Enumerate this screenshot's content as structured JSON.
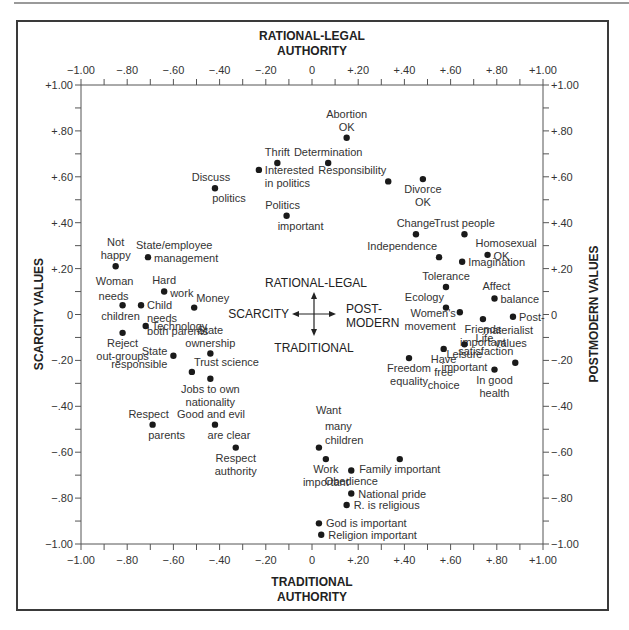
{
  "chart_data": {
    "type": "scatter",
    "title": "",
    "top_axis_title": [
      "RATIONAL-LEGAL",
      "AUTHORITY"
    ],
    "bottom_axis_title": [
      "TRADITIONAL",
      "AUTHORITY"
    ],
    "left_axis_title": "SCARCITY VALUES",
    "right_axis_title": "POSTMODERN VALUES",
    "xlim": [
      -1.0,
      1.0
    ],
    "ylim": [
      -1.0,
      1.0
    ],
    "grid": false,
    "x_tick_labels": [
      "-1.00",
      "-.80",
      "-.60",
      "-.40",
      "-.20",
      "0",
      "+.20",
      "+.40",
      "+.60",
      "+.80",
      "+1.00"
    ],
    "y_tick_labels": [
      "+1.00",
      "+.80",
      "+.60",
      "+.40",
      "+.20",
      "0",
      "-.20",
      "-.40",
      "-.60",
      "-.80",
      "-1.00"
    ],
    "center_compass": {
      "up": "RATIONAL-LEGAL",
      "down": "TRADITIONAL",
      "left": "SCARCITY",
      "right": [
        "POST-",
        "MODERN"
      ]
    },
    "points": [
      {
        "label": [
          "Abortion",
          "OK"
        ],
        "x": 0.15,
        "y": 0.77,
        "pos": "above"
      },
      {
        "label": [
          "Determination"
        ],
        "x": 0.07,
        "y": 0.66,
        "pos": "above"
      },
      {
        "label": [
          "Thrift"
        ],
        "x": -0.15,
        "y": 0.66,
        "pos": "above"
      },
      {
        "label": [
          "Interested",
          "in politics"
        ],
        "x": -0.23,
        "y": 0.63,
        "pos": "right-below"
      },
      {
        "label": [
          "Discuss",
          "politics"
        ],
        "x": -0.42,
        "y": 0.55,
        "pos": "split"
      },
      {
        "label": [
          "Politics",
          "important"
        ],
        "x": -0.11,
        "y": 0.43,
        "pos": "split"
      },
      {
        "label": [
          "Responsibility"
        ],
        "x": 0.33,
        "y": 0.58,
        "pos": "left-above"
      },
      {
        "label": [
          "Divorce",
          "OK"
        ],
        "x": 0.48,
        "y": 0.59,
        "pos": "below"
      },
      {
        "label": [
          "Change"
        ],
        "x": 0.45,
        "y": 0.35,
        "pos": "above"
      },
      {
        "label": [
          "Trust people"
        ],
        "x": 0.66,
        "y": 0.35,
        "pos": "above"
      },
      {
        "label": [
          "Independence"
        ],
        "x": 0.55,
        "y": 0.25,
        "pos": "left-above"
      },
      {
        "label": [
          "Imagination"
        ],
        "x": 0.65,
        "y": 0.23,
        "pos": "right-below"
      },
      {
        "label": [
          "Homosexual",
          "OK"
        ],
        "x": 0.76,
        "y": 0.26,
        "pos": "split-right"
      },
      {
        "label": [
          "Tolerance"
        ],
        "x": 0.58,
        "y": 0.12,
        "pos": "above"
      },
      {
        "label": [
          "Affect",
          "balance"
        ],
        "x": 0.79,
        "y": 0.07,
        "pos": "split-right"
      },
      {
        "label": [
          "Ecology"
        ],
        "x": 0.58,
        "y": 0.03,
        "pos": "left-above"
      },
      {
        "label": [
          "Women's",
          "movement"
        ],
        "x": 0.64,
        "y": 0.01,
        "pos": "left-below"
      },
      {
        "label": [
          "Friends",
          "important"
        ],
        "x": 0.74,
        "y": -0.02,
        "pos": "below"
      },
      {
        "label": [
          "Post-",
          "materialist",
          "values"
        ],
        "x": 0.87,
        "y": -0.01,
        "pos": "split-right"
      },
      {
        "label": [
          "Leisure",
          "important"
        ],
        "x": 0.66,
        "y": -0.13,
        "pos": "below"
      },
      {
        "label": [
          "Have",
          "free",
          "choice"
        ],
        "x": 0.57,
        "y": -0.15,
        "pos": "below"
      },
      {
        "label": [
          "Freedom",
          "equality"
        ],
        "x": 0.42,
        "y": -0.19,
        "pos": "below"
      },
      {
        "label": [
          "Life",
          "satisfaction"
        ],
        "x": 0.88,
        "y": -0.21,
        "pos": "above-left"
      },
      {
        "label": [
          "In good",
          "health"
        ],
        "x": 0.79,
        "y": -0.24,
        "pos": "below"
      },
      {
        "label": [
          "Not",
          "happy"
        ],
        "x": -0.85,
        "y": 0.21,
        "pos": "above"
      },
      {
        "label": [
          "State/employee",
          "management"
        ],
        "x": -0.71,
        "y": 0.25,
        "pos": "split-right"
      },
      {
        "label": [
          "Hard",
          "work"
        ],
        "x": -0.64,
        "y": 0.1,
        "pos": "split-right"
      },
      {
        "label": [
          "Woman",
          "needs",
          "children"
        ],
        "x": -0.82,
        "y": 0.04,
        "pos": "around"
      },
      {
        "label": [
          "Child",
          "needs",
          "both parents"
        ],
        "x": -0.74,
        "y": 0.04,
        "pos": "right-below"
      },
      {
        "label": [
          "Money"
        ],
        "x": -0.51,
        "y": 0.03,
        "pos": "right-above"
      },
      {
        "label": [
          "Technology"
        ],
        "x": -0.72,
        "y": -0.05,
        "pos": "right-below"
      },
      {
        "label": [
          "Reject",
          "out-groups"
        ],
        "x": -0.82,
        "y": -0.08,
        "pos": "below"
      },
      {
        "label": [
          "State",
          "ownership"
        ],
        "x": -0.44,
        "y": -0.17,
        "pos": "above"
      },
      {
        "label": [
          "State",
          "responsible"
        ],
        "x": -0.6,
        "y": -0.18,
        "pos": "left"
      },
      {
        "label": [
          "Trust science"
        ],
        "x": -0.52,
        "y": -0.25,
        "pos": "right-above"
      },
      {
        "label": [
          "Jobs to own",
          "nationality"
        ],
        "x": -0.44,
        "y": -0.28,
        "pos": "below"
      },
      {
        "label": [
          "Respect",
          "parents"
        ],
        "x": -0.69,
        "y": -0.48,
        "pos": "split"
      },
      {
        "label": [
          "Good and evil",
          "are clear"
        ],
        "x": -0.42,
        "y": -0.48,
        "pos": "split"
      },
      {
        "label": [
          "Respect",
          "authority"
        ],
        "x": -0.33,
        "y": -0.58,
        "pos": "below"
      },
      {
        "label": [
          "Want",
          "many",
          "children"
        ],
        "x": 0.03,
        "y": -0.58,
        "pos": "above-right"
      },
      {
        "label": [
          "Work",
          "important"
        ],
        "x": 0.06,
        "y": -0.63,
        "pos": "below"
      },
      {
        "label": [
          "Family important"
        ],
        "x": 0.38,
        "y": -0.63,
        "pos": "below"
      },
      {
        "label": [
          "Obedience"
        ],
        "x": 0.17,
        "y": -0.68,
        "pos": "below"
      },
      {
        "label": [
          "National pride"
        ],
        "x": 0.17,
        "y": -0.78,
        "pos": "right"
      },
      {
        "label": [
          "R. is religious"
        ],
        "x": 0.15,
        "y": -0.83,
        "pos": "right"
      },
      {
        "label": [
          "God is important"
        ],
        "x": 0.03,
        "y": -0.91,
        "pos": "right"
      },
      {
        "label": [
          "Religion important"
        ],
        "x": 0.04,
        "y": -0.96,
        "pos": "right"
      }
    ]
  }
}
